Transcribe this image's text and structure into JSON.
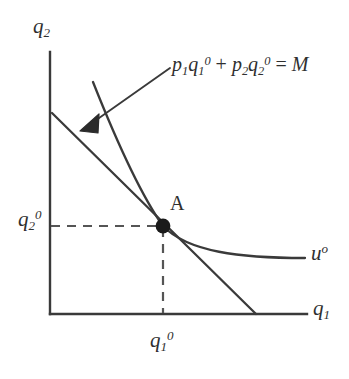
{
  "figure": {
    "type": "consumer-optimum-tangency-diagram",
    "background_color": "#ffffff",
    "ink_color": "#3a3a3a"
  },
  "axes": {
    "y_label": "q",
    "y_label_sub": "2",
    "x_label": "q",
    "x_label_sub": "1",
    "origin": {
      "x": 50,
      "y": 314
    },
    "y_axis_top": {
      "x": 50,
      "y": 52
    },
    "x_axis_right": {
      "x": 305,
      "y": 314
    }
  },
  "ticks": {
    "y_tick_label": "q",
    "y_tick_sub": "2",
    "y_tick_sup": "0",
    "y_tick_value_y": 226,
    "x_tick_label": "q",
    "x_tick_sub": "1",
    "x_tick_sup": "0",
    "x_tick_value_x": 163
  },
  "budget_line": {
    "equation_text": "p",
    "eq_p1_sub": "1",
    "eq_q1": "q",
    "eq_q1_sub": "1",
    "eq_q1_sup": "0",
    "eq_plus": " + ",
    "eq_p2": "p",
    "eq_p2_sub": "2",
    "eq_q2": "q",
    "eq_q2_sub": "2",
    "eq_q2_sup": "0",
    "eq_equals": " = ",
    "eq_M": "M",
    "y_intercept": {
      "x": 52,
      "y": 113
    },
    "x_intercept": {
      "x": 255,
      "y": 314
    }
  },
  "indifference_curve": {
    "label": "u",
    "label_sup": "o",
    "top_point": {
      "x": 93,
      "y": 82
    },
    "right_point": {
      "x": 305,
      "y": 258
    }
  },
  "point_a": {
    "label": "A",
    "x": 163,
    "y": 226
  },
  "annotation": {
    "leader_from": {
      "x": 170,
      "y": 68
    },
    "leader_to": {
      "x": 86,
      "y": 127
    }
  }
}
